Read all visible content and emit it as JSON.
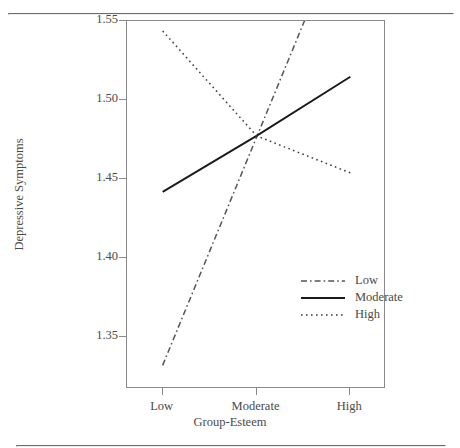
{
  "chart_data": {
    "type": "line",
    "title": "",
    "xlabel": "Group-Esteem",
    "ylabel": "Depressive Symptoms",
    "categories": [
      "Low",
      "Moderate",
      "High"
    ],
    "x": [
      1,
      2,
      3
    ],
    "xlim": [
      0.62,
      3.38
    ],
    "ylim": [
      1.317,
      1.5503
    ],
    "yticks": [
      1.35,
      1.4,
      1.45,
      1.5,
      1.55
    ],
    "ytick_labels": [
      "1.35",
      "1.40",
      "1.45",
      "1.50",
      "1.55"
    ],
    "xtick_labels": [
      "Low",
      "Moderate",
      "High"
    ],
    "grid": false,
    "legend_position": "inside-lower-right",
    "series": [
      {
        "name": "Low",
        "values": [
          1.332,
          1.4765,
          1.621
        ],
        "style": "dash-dot",
        "color": "#555555",
        "clipped_at_top": true
      },
      {
        "name": "Moderate",
        "values": [
          1.442,
          1.4775,
          1.515
        ],
        "style": "solid",
        "color": "#1a1a1a"
      },
      {
        "name": "High",
        "values": [
          1.544,
          1.4775,
          1.454
        ],
        "style": "dotted",
        "color": "#3a3a3a"
      }
    ]
  },
  "legend": {
    "items": [
      {
        "label": "Low",
        "style": "dash-dot"
      },
      {
        "label": "Moderate",
        "style": "solid"
      },
      {
        "label": "High",
        "style": "dotted"
      }
    ]
  },
  "colors": {
    "frame": "#8a8a8a",
    "rule": "#6b6b6b",
    "text": "#4a4a4a",
    "background": "#ffffff"
  }
}
